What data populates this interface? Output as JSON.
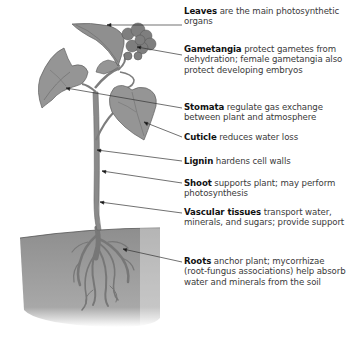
{
  "diagram": {
    "type": "labeled-illustration",
    "colors": {
      "plant": "#8c8c8c",
      "plant_dark": "#6a6a6a",
      "soil": "#9a9a9a",
      "leader_line": "#333333",
      "label_bold": "#111111",
      "label_text": "#3a3a3a"
    },
    "labels": [
      {
        "id": "leaves",
        "term": "Leaves",
        "text": " are the main photosynthetic organs",
        "top": 6,
        "line": {
          "x1": 182,
          "y1": 25,
          "x2": 107,
          "y2": 25
        }
      },
      {
        "id": "gametangia",
        "term": "Gametangia",
        "text": " protect gametes from dehydration; female gametangia also protect developing embryos",
        "top": 44,
        "line": {
          "x1": 182,
          "y1": 55,
          "x2": 137,
          "y2": 47
        }
      },
      {
        "id": "stomata",
        "term": "Stomata",
        "text": " regulate gas exchange between plant and atmosphere",
        "top": 106,
        "line": {
          "x1": 182,
          "y1": 108,
          "x2": 66,
          "y2": 88
        }
      },
      {
        "id": "cuticle",
        "term": "Cuticle",
        "text": " reduces water loss",
        "top": 134,
        "line": {
          "x1": 182,
          "y1": 137,
          "x2": 144,
          "y2": 122
        }
      },
      {
        "id": "lignin",
        "term": "Lignin",
        "text": " hardens cell walls",
        "top": 158,
        "line": {
          "x1": 182,
          "y1": 161,
          "x2": 97,
          "y2": 150
        }
      },
      {
        "id": "shoot",
        "term": "Shoot",
        "text": " supports plant; may perform photosynthesis",
        "top": 180,
        "line": {
          "x1": 182,
          "y1": 183,
          "x2": 102,
          "y2": 171
        }
      },
      {
        "id": "vascular-tissues",
        "term": "Vascular tissues",
        "text": " transport water, minerals, and sugars; provide support",
        "top": 207,
        "line": {
          "x1": 182,
          "y1": 213,
          "x2": 100,
          "y2": 202
        }
      },
      {
        "id": "roots",
        "term": "Roots",
        "text": " anchor plant; mycorrhizae (root-fungus associations) help absorb water and minerals from the soil",
        "top": 255,
        "line": {
          "x1": 182,
          "y1": 262,
          "x2": 123,
          "y2": 249
        }
      }
    ]
  }
}
